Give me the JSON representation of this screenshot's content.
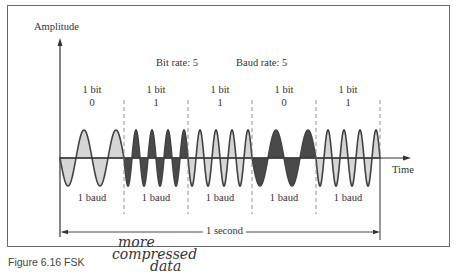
{
  "diagram": {
    "title": "FSK",
    "y_axis_label": "Amplitude",
    "x_axis_label": "Time",
    "bit_rate": "Bit rate: 5",
    "baud_rate": "Baud rate: 5",
    "bits": [
      {
        "label": "1 bit",
        "value": "0",
        "baud": "1 baud",
        "fill": "#d6d6d6",
        "cycles": 2
      },
      {
        "label": "1 bit",
        "value": "1",
        "baud": "1 baud",
        "fill": "#4a4a4a",
        "cycles": 4
      },
      {
        "label": "1 bit",
        "value": "1",
        "baud": "1 baud",
        "fill": "#d6d6d6",
        "cycles": 4
      },
      {
        "label": "1 bit",
        "value": "0",
        "baud": "1 baud",
        "fill": "#4a4a4a",
        "cycles": 2
      },
      {
        "label": "1 bit",
        "value": "1",
        "baud": "1 baud",
        "fill": "#d6d6d6",
        "cycles": 4
      }
    ],
    "duration_label": "1 second",
    "caption": "Figure 6.16  FSK",
    "handwritten_note": [
      "more",
      "compressed",
      "data"
    ]
  }
}
